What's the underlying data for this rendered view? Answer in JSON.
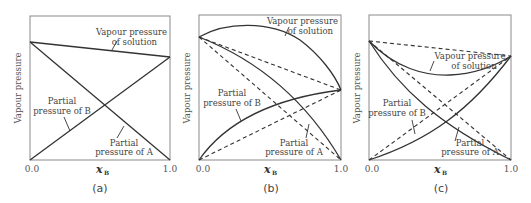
{
  "figure": {
    "panels": [
      {
        "caption": "(a)",
        "type": "ideal",
        "y_axis_label": "Vapour pressure",
        "x_axis_label": "x",
        "x_axis_subscript": "B",
        "x_ticks": [
          "0.0",
          "1.0"
        ],
        "labels": {
          "solution_line1": "Vapour pressure",
          "solution_line2": "of solution",
          "partial_b_line1": "Partial",
          "partial_b_line2": "pressure of B",
          "partial_a_line1": "Partial",
          "partial_a_line2": "pressure of A"
        }
      },
      {
        "caption": "(b)",
        "type": "positive deviation",
        "y_axis_label": "Vapour pressure",
        "x_axis_label": "x",
        "x_axis_subscript": "B",
        "x_ticks": [
          "0.0",
          "1.0"
        ],
        "labels": {
          "solution_line1": "Vapour pressure",
          "solution_line2": "of solution",
          "partial_b_line1": "Partial",
          "partial_b_line2": "pressure of B",
          "partial_a_line1": "Partial",
          "partial_a_line2": "pressure of A"
        }
      },
      {
        "caption": "(c)",
        "type": "negative deviation",
        "y_axis_label": "Vapour pressure",
        "x_axis_label": "x",
        "x_axis_subscript": "B",
        "x_ticks": [
          "0.0",
          "1.0"
        ],
        "labels": {
          "solution_line1": "Vapour pressure",
          "solution_line2": "of solution",
          "partial_b_line1": "Partial",
          "partial_b_line2": "pressure of B",
          "partial_a_line1": "Partial",
          "partial_a_line2": "pressure of A"
        }
      }
    ],
    "colors": {
      "line": "#333333",
      "frame": "#8a8a8a",
      "text": "#444444"
    }
  }
}
